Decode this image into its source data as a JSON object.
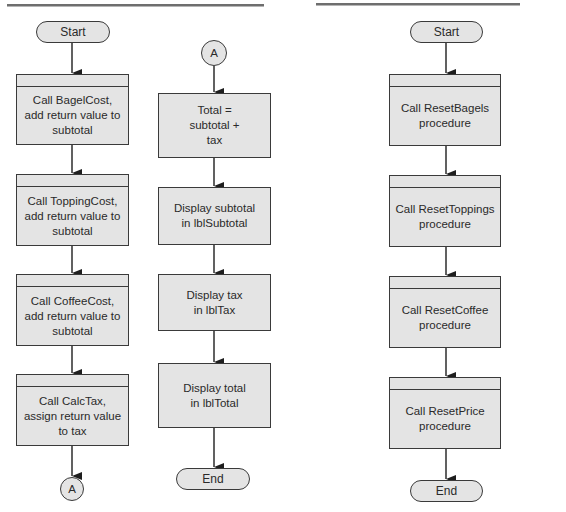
{
  "left_chart": {
    "column1": {
      "start": "Start",
      "steps": [
        "Call BagelCost,\nadd return value to\nsubtotal",
        "Call ToppingCost,\nadd return value to\nsubtotal",
        "Call CoffeeCost,\nadd return value to\nsubtotal",
        "Call CalcTax,\nassign return value\nto tax"
      ],
      "connector": "A"
    },
    "column2": {
      "connector": "A",
      "steps": [
        "Total =\nsubtotal +\ntax",
        "Display subtotal\nin lblSubtotal",
        "Display tax\nin lblTax",
        "Display total\nin lblTotal"
      ],
      "end": "End"
    }
  },
  "right_chart": {
    "start": "Start",
    "steps": [
      "Call ResetBagels\nprocedure",
      "Call ResetToppings\nprocedure",
      "Call ResetCoffee\nprocedure",
      "Call ResetPrice\nprocedure"
    ],
    "end": "End"
  },
  "colors": {
    "shape_fill": "#e4e4e4",
    "shape_stroke": "#3a3a3a",
    "arrow": "#1e1e1e",
    "rule": "#6e6e6e"
  }
}
